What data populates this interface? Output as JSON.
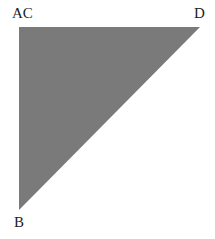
{
  "diagram": {
    "fill_color": "#7a7a7a",
    "vertices": {
      "top_left": [
        19,
        27
      ],
      "top_right": [
        200,
        27
      ],
      "bottom": [
        19,
        210
      ]
    },
    "labels": {
      "top_left": "AC",
      "top_right": "D",
      "bottom": "B"
    }
  }
}
